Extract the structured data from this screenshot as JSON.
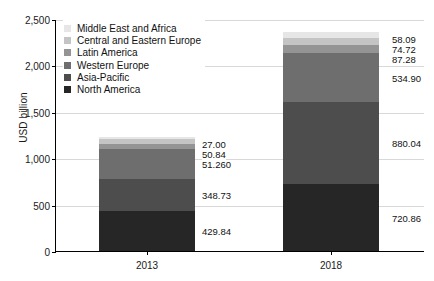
{
  "chart_data": {
    "type": "bar",
    "stacked": true,
    "title": "",
    "xlabel": "",
    "ylabel": "USD billion",
    "categories": [
      "2013",
      "2018"
    ],
    "ylim": [
      0,
      2500
    ],
    "ytick_labels": [
      "0",
      "500",
      "1,000",
      "1,500",
      "2,000",
      "2,500"
    ],
    "ytick_values": [
      0,
      500,
      1000,
      1500,
      2000,
      2500
    ],
    "grid": true,
    "legend_position": "top-left inside plot",
    "series": [
      {
        "name": "North America",
        "color": "#262626",
        "values": [
          429.84,
          720.86
        ],
        "labels": [
          "429.84",
          "720.86"
        ]
      },
      {
        "name": "Asia-Pacific",
        "color": "#4d4d4d",
        "values": [
          348.73,
          880.04
        ],
        "labels": [
          "348.73",
          "880.04"
        ]
      },
      {
        "name": "Western Europe",
        "color": "#6e6e6e",
        "values": [
          325.4,
          534.9
        ],
        "labels": [
          "325.40",
          "534.90"
        ]
      },
      {
        "name": "Latin America",
        "color": "#949494",
        "values": [
          51.26,
          87.28
        ],
        "labels": [
          "51.26",
          "87.28"
        ]
      },
      {
        "name": "Central and Eastern Europe",
        "color": "#c4c4c4",
        "values": [
          50.84,
          74.72
        ],
        "labels": [
          "50.84",
          "74.72"
        ]
      },
      {
        "name": "Middle East and Africa",
        "color": "#e6e6e6",
        "values": [
          27.0,
          58.09
        ],
        "labels": [
          "27.00",
          "58.09"
        ]
      }
    ],
    "legend_order": [
      "Middle East and Africa",
      "Central and Eastern Europe",
      "Latin America",
      "Western Europe",
      "Asia-Pacific",
      "North America"
    ]
  },
  "legend": {
    "items": [
      {
        "label": "Middle East and Africa",
        "color": "#e6e6e6"
      },
      {
        "label": "Central and Eastern Europe",
        "color": "#c4c4c4"
      },
      {
        "label": "Latin America",
        "color": "#949494"
      },
      {
        "label": "Western Europe",
        "color": "#6e6e6e"
      },
      {
        "label": "Asia-Pacific",
        "color": "#4d4d4d"
      },
      {
        "label": "North America",
        "color": "#262626"
      }
    ]
  },
  "axes": {
    "y_title": "USD billion",
    "y_ticks": [
      "2,500",
      "2,000",
      "1,500",
      "1,000",
      "500",
      "0"
    ],
    "x_ticks": [
      "2013",
      "2018"
    ]
  },
  "value_labels": {
    "y2013": [
      "27.00",
      "50.84",
      "51.26",
      "325.40",
      "348.73",
      "429.84"
    ],
    "y2018": [
      "58.09",
      "74.72",
      "87.28",
      "534.90",
      "880.04",
      "720.86"
    ]
  }
}
